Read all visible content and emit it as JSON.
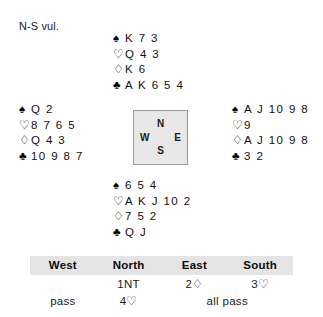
{
  "vulnerability": "N-S vul.",
  "suit_symbols": {
    "spade": "♠",
    "heart": "♡",
    "diamond": "♢",
    "club": "♣"
  },
  "compass": {
    "north": "N",
    "east": "E",
    "south": "S",
    "west": "W"
  },
  "hands": {
    "north": {
      "label": "North",
      "spades": "K 7 3",
      "hearts": "Q 4 3",
      "diamonds": "K 6",
      "clubs": "A K 6 5 4"
    },
    "west": {
      "label": "West",
      "spades": "Q 2",
      "hearts": "8 7 6 5",
      "diamonds": "Q 4 3",
      "clubs": "10 9 8 7"
    },
    "east": {
      "label": "East",
      "spades": "A J 10 9 8",
      "hearts": "9",
      "diamonds": "A J 10 9 8",
      "clubs": "3 2"
    },
    "south": {
      "label": "South",
      "spades": "6 5 4",
      "hearts": "A K J 10 2",
      "diamonds": "7 5 2",
      "clubs": "Q J"
    }
  },
  "auction": {
    "headers": [
      "West",
      "North",
      "East",
      "South"
    ],
    "rows": [
      {
        "west": "",
        "north": "1NT",
        "east": "2♢",
        "south": "3♡"
      },
      {
        "west": "pass",
        "north": "4♡",
        "east_span": "all pass"
      }
    ]
  }
}
